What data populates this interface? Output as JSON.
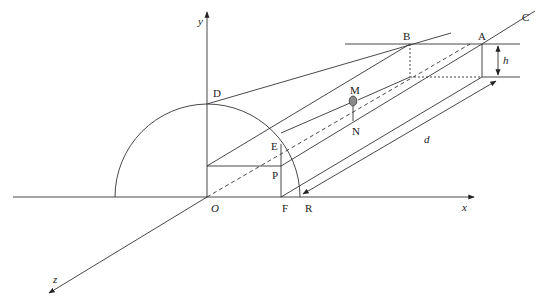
{
  "diagram": {
    "type": "geometric 3D coordinate diagram",
    "axes": {
      "x_label": "x",
      "y_label": "y",
      "z_label": "z",
      "origin_label": "O"
    },
    "points": {
      "A": "A",
      "B": "B",
      "C": "C",
      "D": "D",
      "E": "E",
      "F": "F",
      "M": "M",
      "N": "N",
      "P": "P",
      "R": "R"
    },
    "dimensions": {
      "height": "h",
      "distance": "d"
    },
    "colors": {
      "line": "#333333",
      "ball_fill": "#8a8a8a",
      "background": "#ffffff"
    }
  }
}
